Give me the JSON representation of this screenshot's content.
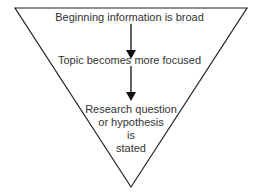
{
  "diagram": {
    "shape": "inverted-triangle",
    "stroke_color": "#222222",
    "text_color": "#333333",
    "stages": [
      {
        "label": "Beginning information is broad"
      },
      {
        "label": "Topic becomes more focused"
      },
      {
        "lines": [
          "Research question",
          "or hypothesis",
          "is",
          "stated"
        ]
      }
    ],
    "arrows": [
      {
        "from": "stage-1",
        "to": "stage-2"
      },
      {
        "from": "stage-2",
        "to": "stage-3"
      }
    ]
  }
}
